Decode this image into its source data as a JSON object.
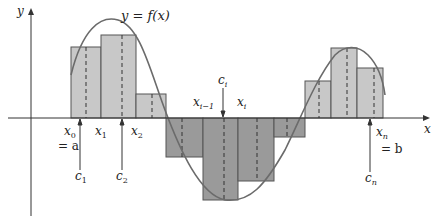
{
  "figure": {
    "title_label": "y = f(x)",
    "axis_labels": {
      "x": "x",
      "y": "y"
    },
    "colors": {
      "positive_fill": "#c8c8c8",
      "negative_fill": "#9a9a9a",
      "stroke": "#555555",
      "curve": "#6b6b6b",
      "axis": "#333333"
    },
    "partition_labels": {
      "x0": "x",
      "x0_sub": "0",
      "eq_a": "= a",
      "x1": "x",
      "x1_sub": "1",
      "x2": "x",
      "x2_sub": "2",
      "xim1": "x",
      "xim1_sub": "i−1",
      "xi": "x",
      "xi_sub": "i",
      "xn": "x",
      "xn_sub": "n",
      "eq_b": "= b",
      "c1": "c",
      "c1_sub": "1",
      "c2": "c",
      "c2_sub": "2",
      "ci": "c",
      "ci_sub": "i",
      "cn": "c",
      "cn_sub": "n"
    }
  },
  "chart_data": {
    "type": "bar",
    "xlabel": "x",
    "ylabel": "y",
    "baseline_px": 118,
    "rectangles": [
      {
        "x0": 71,
        "x1": 101,
        "top": 47,
        "sign": "positive",
        "c": 86
      },
      {
        "x0": 101,
        "x1": 136,
        "top": 35,
        "sign": "positive",
        "c": 122
      },
      {
        "x0": 136,
        "x1": 166,
        "top": 94,
        "sign": "positive",
        "c": 152
      },
      {
        "x0": 166,
        "x1": 203,
        "bottom": 157,
        "sign": "negative",
        "c": 182
      },
      {
        "x0": 203,
        "x1": 238,
        "bottom": 200,
        "sign": "negative",
        "c": 224
      },
      {
        "x0": 238,
        "x1": 274,
        "bottom": 181,
        "sign": "negative",
        "c": 257
      },
      {
        "x0": 274,
        "x1": 305,
        "bottom": 137,
        "sign": "negative",
        "c": 287
      },
      {
        "x0": 305,
        "x1": 331,
        "top": 81,
        "sign": "positive",
        "c": 319
      },
      {
        "x0": 331,
        "x1": 357,
        "top": 48,
        "sign": "positive",
        "c": 347
      },
      {
        "x0": 357,
        "x1": 383,
        "top": 68,
        "sign": "positive",
        "c": 374
      }
    ],
    "grid": false,
    "legend": "none"
  }
}
